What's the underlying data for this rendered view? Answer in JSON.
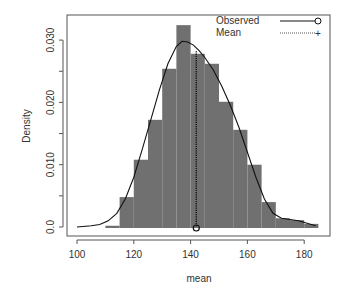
{
  "chart_data": {
    "type": "bar",
    "subtype": "histogram-with-density",
    "title": "",
    "xlabel": "mean",
    "ylabel": "Density",
    "xlim": [
      96.5,
      189
    ],
    "ylim": [
      -0.0014,
      0.0343
    ],
    "x_ticks": [
      100,
      120,
      140,
      160,
      180
    ],
    "x_tick_labels": [
      "100",
      "120",
      "140",
      "160",
      "180"
    ],
    "y_ticks": [
      0.0,
      0.005,
      0.01,
      0.015,
      0.02,
      0.025,
      0.03
    ],
    "y_tick_labels": [
      "0.0",
      "",
      "0.010",
      "",
      "0.020",
      "",
      "0.030"
    ],
    "grid": false,
    "legend_position": "top-right",
    "bin_width": 5,
    "bins": [
      {
        "from": 110,
        "to": 115,
        "density": 0.0002
      },
      {
        "from": 115,
        "to": 120,
        "density": 0.0048
      },
      {
        "from": 120,
        "to": 125,
        "density": 0.0108
      },
      {
        "from": 125,
        "to": 130,
        "density": 0.0172
      },
      {
        "from": 130,
        "to": 135,
        "density": 0.0254
      },
      {
        "from": 135,
        "to": 140,
        "density": 0.0324
      },
      {
        "from": 140,
        "to": 145,
        "density": 0.0278
      },
      {
        "from": 145,
        "to": 150,
        "density": 0.0262
      },
      {
        "from": 150,
        "to": 155,
        "density": 0.0201
      },
      {
        "from": 155,
        "to": 160,
        "density": 0.0156
      },
      {
        "from": 160,
        "to": 165,
        "density": 0.01
      },
      {
        "from": 165,
        "to": 170,
        "density": 0.004
      },
      {
        "from": 170,
        "to": 175,
        "density": 0.0014
      },
      {
        "from": 175,
        "to": 180,
        "density": 0.0011
      },
      {
        "from": 180,
        "to": 185,
        "density": 0.0005
      }
    ],
    "series": [
      {
        "name": "Observed",
        "style": "solid",
        "marker": "circle",
        "x": [
          100,
          105,
          108,
          111,
          114,
          117,
          120,
          123,
          126,
          129,
          132,
          135,
          137,
          139,
          141,
          143,
          145,
          148,
          151,
          154,
          157,
          160,
          163,
          166,
          169,
          172,
          175,
          178,
          181,
          184
        ],
        "y": [
          0.0,
          0.0002,
          0.0004,
          0.001,
          0.0022,
          0.0045,
          0.008,
          0.0125,
          0.0172,
          0.022,
          0.0262,
          0.029,
          0.0298,
          0.0297,
          0.0292,
          0.0283,
          0.0272,
          0.0252,
          0.0226,
          0.0195,
          0.016,
          0.012,
          0.008,
          0.0045,
          0.0022,
          0.0014,
          0.0012,
          0.001,
          0.0006,
          0.0002
        ]
      },
      {
        "name": "Mean",
        "style": "dotted",
        "marker": "plus",
        "value": 142
      }
    ],
    "mean_marker": {
      "x": 142,
      "y": 0.0,
      "shape": "circle"
    }
  },
  "legend": {
    "items": [
      {
        "label": "Observed"
      },
      {
        "label": "Mean"
      }
    ]
  },
  "colors": {
    "bar_fill": "#707070",
    "line": "#111111",
    "axis": "#555555",
    "text": "#333333"
  }
}
